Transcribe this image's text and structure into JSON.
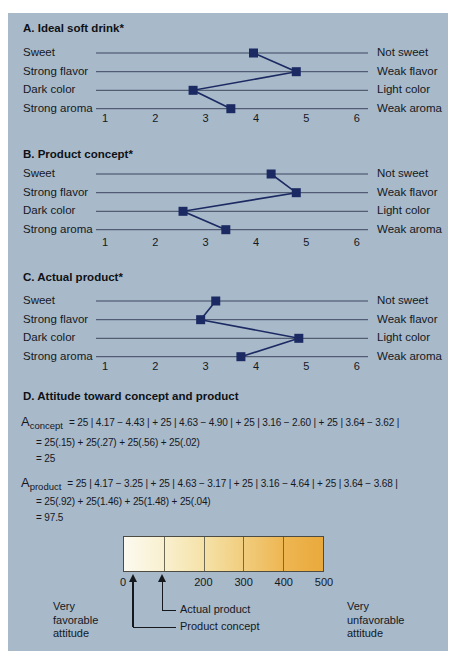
{
  "panel": {
    "bg": "#a8b9c9",
    "navy": "#1b2a62",
    "rule_color": "#3d4660"
  },
  "sections": [
    {
      "title": "A. Ideal soft drink*",
      "left_labels": [
        "Sweet",
        "Strong flavor",
        "Dark color",
        "Strong aroma"
      ],
      "right_labels": [
        "Not sweet",
        "Weak flavor",
        "Light color",
        "Weak aroma"
      ]
    },
    {
      "title": "B. Product concept*",
      "left_labels": [
        "Sweet",
        "Strong flavor",
        "Dark color",
        "Strong aroma"
      ],
      "right_labels": [
        "Not sweet",
        "Weak flavor",
        "Light color",
        "Weak aroma"
      ]
    },
    {
      "title": "C. Actual product*",
      "left_labels": [
        "Sweet",
        "Strong flavor",
        "Dark color",
        "Strong aroma"
      ],
      "right_labels": [
        "Not sweet",
        "Weak flavor",
        "Light color",
        "Weak aroma"
      ]
    }
  ],
  "axis": {
    "ticks": [
      "1",
      "2",
      "3",
      "4",
      "5",
      "6"
    ],
    "min": 1,
    "max": 6
  },
  "attitude": {
    "title": "D. Attitude toward concept and product",
    "concept": {
      "var": "A",
      "sub": "concept",
      "lines": [
        "= 25 | 4.17 − 4.43 | + 25 | 4.63 − 4.90 | + 25 | 3.16 − 2.60 | + 25 | 3.64 − 3.62 |",
        "= 25(.15) + 25(.27) + 25(.56) + 25(.02)",
        "= 25"
      ]
    },
    "product": {
      "var": "A",
      "sub": "product",
      "lines": [
        "= 25 | 4.17 − 3.25 | + 25 | 4.63 − 3.17 | + 25 | 3.16 − 4.64 | + 25 | 3.64 − 3.68 |",
        "= 25(.92) + 25(1.46) + 25(1.48) + 25(.04)",
        "= 97.5"
      ]
    }
  },
  "scale": {
    "range": [
      0,
      500
    ],
    "ticks": [
      {
        "label": "0",
        "value": 0
      },
      {
        "label": "200",
        "value": 200
      },
      {
        "label": "300",
        "value": 300
      },
      {
        "label": "400",
        "value": 400
      },
      {
        "label": "500",
        "value": 500
      }
    ],
    "pointers": [
      {
        "label": "Actual product",
        "value": 97.5
      },
      {
        "label": "Product concept",
        "value": 25
      }
    ],
    "left_label": "Very\nfavorable\nattitude",
    "right_label": "Very\nunfavorable\nattitude",
    "gradient": [
      "#fcfaf0",
      "#f9f0cf",
      "#f5e2a8",
      "#f1cd7e",
      "#eeb652",
      "#e9a93c"
    ]
  },
  "chart_data": [
    {
      "type": "line",
      "title": "A. Ideal soft drink*",
      "categories": [
        "Sweet / Not sweet",
        "Strong flavor / Weak flavor",
        "Dark color / Light color",
        "Strong aroma / Weak aroma"
      ],
      "values": [
        3.95,
        4.8,
        2.75,
        3.5
      ],
      "xlim": [
        1,
        6
      ],
      "xticks": [
        1,
        2,
        3,
        4,
        5,
        6
      ],
      "orientation": "horizontal profile (semantic differential)",
      "marker": "square",
      "grid": false,
      "legend": "none"
    },
    {
      "type": "line",
      "title": "B. Product concept*",
      "categories": [
        "Sweet / Not sweet",
        "Strong flavor / Weak flavor",
        "Dark color / Light color",
        "Strong aroma / Weak aroma"
      ],
      "values": [
        4.3,
        4.8,
        2.55,
        3.4
      ],
      "xlim": [
        1,
        6
      ],
      "xticks": [
        1,
        2,
        3,
        4,
        5,
        6
      ],
      "orientation": "horizontal profile (semantic differential)",
      "marker": "square",
      "grid": false,
      "legend": "none"
    },
    {
      "type": "line",
      "title": "C. Actual product*",
      "categories": [
        "Sweet / Not sweet",
        "Strong flavor / Weak flavor",
        "Dark color / Light color",
        "Strong aroma / Weak aroma"
      ],
      "values": [
        3.2,
        2.9,
        4.85,
        3.7
      ],
      "xlim": [
        1,
        6
      ],
      "xticks": [
        1,
        2,
        3,
        4,
        5,
        6
      ],
      "orientation": "horizontal profile (semantic differential)",
      "marker": "square",
      "grid": false,
      "legend": "none"
    },
    {
      "type": "scatter",
      "title": "D. Attitude toward concept and product",
      "x": [
        25,
        97.5
      ],
      "labels": [
        "Product concept",
        "Actual product"
      ],
      "xlim": [
        0,
        500
      ],
      "xticks": [
        0,
        200,
        300,
        400,
        500
      ],
      "annotations": [
        "Very favorable attitude",
        "Very unfavorable attitude"
      ],
      "style": "color-gradient scale bar with upward arrows"
    }
  ]
}
